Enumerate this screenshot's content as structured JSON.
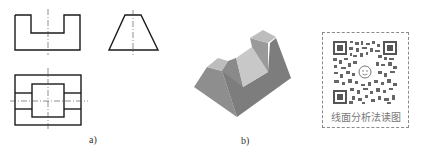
{
  "figure_a": {
    "label": "a)",
    "views": [
      {
        "name": "front-view",
        "shape": "U-notched rectangle"
      },
      {
        "name": "side-view",
        "shape": "trapezoid"
      },
      {
        "name": "top-view",
        "shape": "rectangle with inner square and slots"
      }
    ]
  },
  "figure_b": {
    "label": "b)",
    "description": "isometric solid with trapezoidal cross-section and a V-shaped center groove",
    "colors": {
      "top": "#b9b9b9",
      "left": "#8e8e8e",
      "front": "#7a7a7a",
      "notch": "#c6c6c6"
    }
  },
  "qr": {
    "caption": "线面分析法读图",
    "frame_color": "#8a8a8a"
  },
  "colors": {
    "line": "#1a1a1a",
    "centerline": "#333333"
  }
}
